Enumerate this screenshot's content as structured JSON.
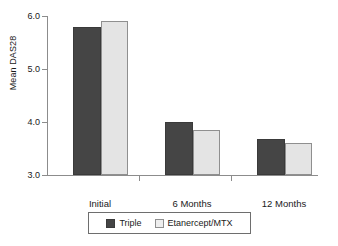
{
  "chart_data": {
    "type": "bar",
    "title": "",
    "xlabel": "",
    "ylabel": "Mean DAS28",
    "categories": [
      "Initial",
      "6 Months",
      "12 Months"
    ],
    "series": [
      {
        "name": "Triple",
        "color": "#454545",
        "values": [
          5.8,
          4.0,
          3.68
        ]
      },
      {
        "name": "Etanercept/MTX",
        "color": "#e4e4e4",
        "values": [
          5.9,
          3.85,
          3.6
        ]
      }
    ],
    "ylim": [
      3.0,
      6.0
    ],
    "ytick_labels": [
      "3.0",
      "4.0",
      "5.0",
      "6.0"
    ],
    "ytick_values": [
      3.0,
      4.0,
      5.0,
      6.0
    ],
    "grid": false,
    "legend_position": "bottom"
  },
  "axis": {
    "y_title": "Mean DAS28",
    "y_labels": [
      "6.0",
      "5.0",
      "4.0",
      "3.0"
    ]
  },
  "categories": [
    {
      "label": "Initial"
    },
    {
      "label": "6 Months"
    },
    {
      "label": "12 Months"
    }
  ],
  "legend": {
    "items": [
      {
        "label": "Triple",
        "swatch": "dark-square-swatch"
      },
      {
        "label": "Etanercept/MTX",
        "swatch": "light-square-swatch"
      }
    ]
  }
}
